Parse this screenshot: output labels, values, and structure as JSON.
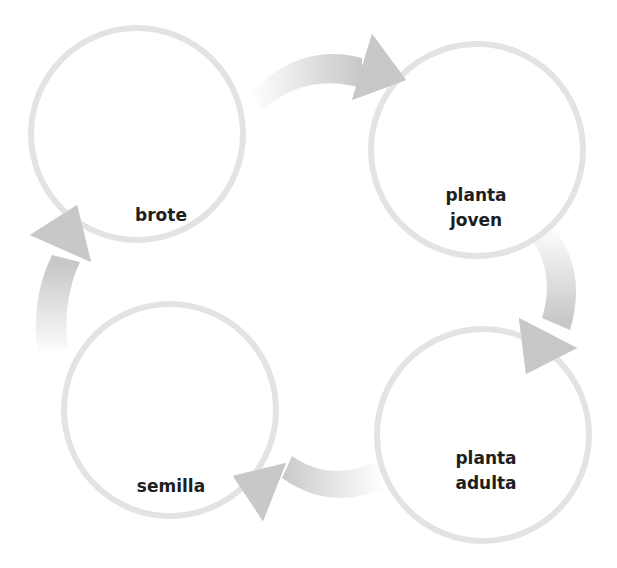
{
  "diagram": {
    "type": "cycle",
    "colors": {
      "background": "#ffffff",
      "circle_stroke": "#e3e3e3",
      "arrow_fill": "#c8c8c8",
      "label_text": "#1e1e1e"
    },
    "stages": [
      {
        "id": "brote",
        "label_lines": [
          "brote"
        ]
      },
      {
        "id": "planta-joven",
        "label_lines": [
          "planta",
          "joven"
        ]
      },
      {
        "id": "planta-adulta",
        "label_lines": [
          "planta",
          "adulta"
        ]
      },
      {
        "id": "semilla",
        "label_lines": [
          "semilla"
        ]
      }
    ],
    "arrows": [
      {
        "from": "brote",
        "to": "planta joven"
      },
      {
        "from": "planta joven",
        "to": "planta adulta"
      },
      {
        "from": "planta adulta",
        "to": "semilla"
      },
      {
        "from": "semilla",
        "to": "brote"
      }
    ]
  }
}
